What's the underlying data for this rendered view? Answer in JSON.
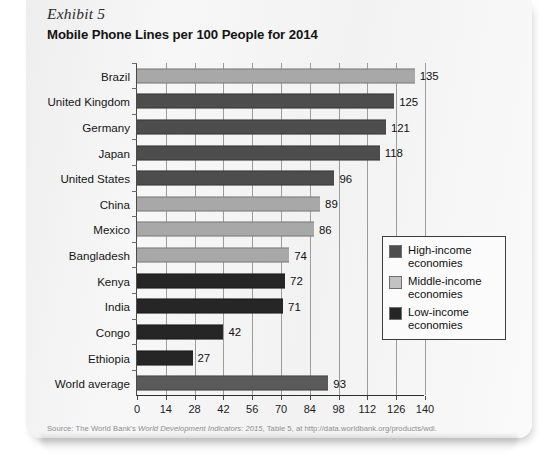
{
  "exhibit": {
    "label": "Exhibit 5"
  },
  "header": {
    "title": "Mobile Phone Lines per 100 People for 2014"
  },
  "source": {
    "prefix": "Source:  The World Bank's ",
    "italic": "World Development Indicators: 2015",
    "suffix": ", Table 5, at http://data.worldbank.org/products/wdi."
  },
  "legend": {
    "items": [
      {
        "label": "High-income economies",
        "color": "#4d4d4d",
        "key": "high"
      },
      {
        "label": "Middle-income economies",
        "color": "#c2c2c2",
        "key": "middle"
      },
      {
        "label": "Low-income economies",
        "color": "#262626",
        "key": "low"
      }
    ]
  },
  "colors": {
    "high_income": "#4d4d4d",
    "middle_income": "#a8a8a8",
    "low_income": "#262626",
    "world_average": "#5a5a5a",
    "axis": "#2e2e2e",
    "grid": "#9c9c9c",
    "card": "#f4f4f4"
  },
  "chart_data": {
    "type": "bar",
    "orientation": "horizontal",
    "title": "Mobile Phone Lines per 100 People for 2014",
    "subtitle": "Exhibit 5",
    "xlabel": "",
    "ylabel": "",
    "xlim": [
      0,
      140
    ],
    "xticks": [
      0,
      14,
      28,
      42,
      56,
      70,
      84,
      98,
      112,
      126,
      140
    ],
    "grid": "vertical",
    "legend_position": "middle-right-inside",
    "categories": [
      "Brazil",
      "United Kingdom",
      "Germany",
      "Japan",
      "United States",
      "China",
      "Mexico",
      "Bangladesh",
      "Kenya",
      "India",
      "Congo",
      "Ethiopia",
      "World average"
    ],
    "values": [
      135,
      125,
      121,
      118,
      96,
      89,
      86,
      74,
      72,
      71,
      42,
      27,
      93
    ],
    "groups": [
      "middle-income",
      "high-income",
      "high-income",
      "high-income",
      "high-income",
      "middle-income",
      "middle-income",
      "middle-income",
      "low-income",
      "low-income",
      "low-income",
      "low-income",
      "world-average"
    ],
    "bars": [
      {
        "category": "Brazil",
        "value": 135,
        "group": "middle-income",
        "color": "#a8a8a8"
      },
      {
        "category": "United Kingdom",
        "value": 125,
        "group": "high-income",
        "color": "#4d4d4d"
      },
      {
        "category": "Germany",
        "value": 121,
        "group": "high-income",
        "color": "#4d4d4d"
      },
      {
        "category": "Japan",
        "value": 118,
        "group": "high-income",
        "color": "#4d4d4d"
      },
      {
        "category": "United States",
        "value": 96,
        "group": "high-income",
        "color": "#4d4d4d"
      },
      {
        "category": "China",
        "value": 89,
        "group": "middle-income",
        "color": "#a8a8a8"
      },
      {
        "category": "Mexico",
        "value": 86,
        "group": "middle-income",
        "color": "#a8a8a8"
      },
      {
        "category": "Bangladesh",
        "value": 74,
        "group": "middle-income",
        "color": "#a8a8a8"
      },
      {
        "category": "Kenya",
        "value": 72,
        "group": "low-income",
        "color": "#262626"
      },
      {
        "category": "India",
        "value": 71,
        "group": "low-income",
        "color": "#262626"
      },
      {
        "category": "Congo",
        "value": 42,
        "group": "low-income",
        "color": "#262626"
      },
      {
        "category": "Ethiopia",
        "value": 27,
        "group": "low-income",
        "color": "#262626"
      },
      {
        "category": "World average",
        "value": 93,
        "group": "world-average",
        "color": "#5a5a5a"
      }
    ]
  }
}
